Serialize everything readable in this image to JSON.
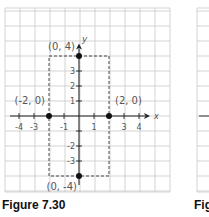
{
  "chart_data": {
    "type": "scatter",
    "title": "",
    "xlabel": "x",
    "ylabel": "y",
    "xlim": [
      -5,
      6
    ],
    "ylim": [
      -5,
      5
    ],
    "grid": true,
    "x_tick_labels": [
      "-4",
      "-3",
      "-1",
      "1",
      "3",
      "4"
    ],
    "y_tick_labels": [
      "3",
      "2",
      "1",
      "-2",
      "-3"
    ],
    "points": [
      {
        "x": 0,
        "y": 4,
        "label": "(0, 4)"
      },
      {
        "x": -2,
        "y": 0,
        "label": "(-2, 0)"
      },
      {
        "x": 2,
        "y": 0,
        "label": "(2, 0)"
      },
      {
        "x": 0,
        "y": -4,
        "label": "(0, -4)"
      }
    ],
    "annotations": [
      {
        "type": "dashed-rectangle",
        "x": [
          -2,
          2
        ],
        "y": [
          -4,
          4
        ]
      }
    ]
  },
  "figure": {
    "caption": "Figure 7.30",
    "next_caption_partial": "Fig"
  }
}
